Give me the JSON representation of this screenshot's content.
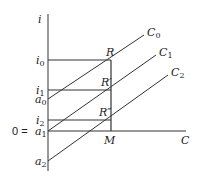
{
  "diagram": {
    "axes": {
      "y_label": "i",
      "x_label": "C"
    },
    "y_ticks": [
      {
        "main": "i",
        "sub": "0",
        "y": 60
      },
      {
        "main": "i",
        "sub": "1",
        "y": 90
      },
      {
        "main": "a",
        "sub": "0",
        "y": 99
      },
      {
        "main": "i",
        "sub": "2",
        "y": 120
      },
      {
        "main": "a",
        "sub": "1",
        "y": 131,
        "prefix": "0 ="
      },
      {
        "main": "a",
        "sub": "2",
        "y": 161
      }
    ],
    "lines": [
      {
        "label": "C",
        "sub": "0"
      },
      {
        "label": "C",
        "sub": "1"
      },
      {
        "label": "C",
        "sub": "2"
      }
    ],
    "points": [
      {
        "label": "R",
        "prime": ""
      },
      {
        "label": "R",
        "prime": "′"
      },
      {
        "label": "R",
        "prime": "″"
      },
      {
        "label": "M",
        "prime": ""
      }
    ],
    "zero_prefix": "0 ="
  }
}
